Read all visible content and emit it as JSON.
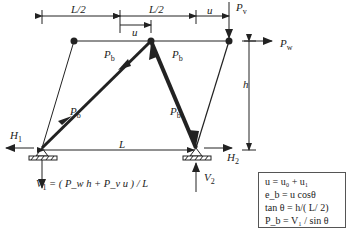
{
  "diagram": {
    "type": "truss-structural-diagram",
    "colors": {
      "ink": "#222222",
      "background": "#ffffff",
      "box_border": "#555555"
    },
    "dimensions": {
      "top_left_span": "L/2",
      "top_right_span": "L/2",
      "offset_u_middle": "u",
      "offset_u_right": "u",
      "height": "h",
      "base_span": "L"
    },
    "loads": {
      "vertical_load": "P",
      "vertical_load_sub": "v",
      "horizontal_load": "P",
      "horizontal_load_sub": "w"
    },
    "member_forces": {
      "left_upper": "P",
      "left_upper_sub": "b",
      "left_lower": "P",
      "left_lower_sub": "b",
      "right_upper": "P",
      "right_upper_sub": "b",
      "right_lower": "P",
      "right_lower_sub": "b"
    },
    "reactions": {
      "h1": "H",
      "h1_sub": "1",
      "h2": "H",
      "h2_sub": "2",
      "v1": "V",
      "v1_sub": "1",
      "v2": "V",
      "v2_sub": "2"
    },
    "v1_formula": "= ( P_w h + P_v u ) / L",
    "equations_box": [
      "u = u₀ + u₁",
      "e_b =  u cosθ",
      "tan θ = h/( L/ 2)",
      "P_b  = V₁ / sin θ"
    ]
  }
}
